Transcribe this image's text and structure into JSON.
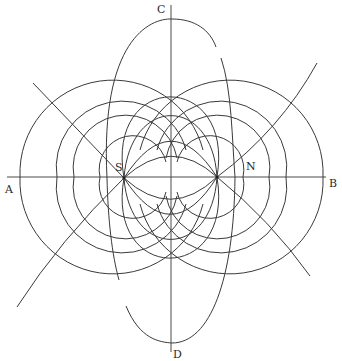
{
  "figure": {
    "labels": {
      "top": "C",
      "bottom": "D",
      "left": "A",
      "right": "B",
      "south_pole": "S",
      "north_pole": "N"
    },
    "poles": [
      {
        "name": "S",
        "x": 124,
        "y": 178
      },
      {
        "name": "N",
        "x": 217,
        "y": 177
      }
    ],
    "colors": {
      "ink": "#3a3a3a",
      "background": "#ffffff"
    }
  }
}
